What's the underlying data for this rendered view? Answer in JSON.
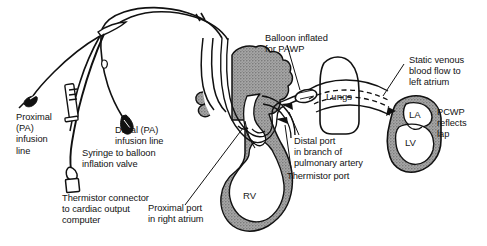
{
  "figure": {
    "type": "medical-line-illustration",
    "background_color": "#ffffff",
    "ink_color": "#111111",
    "tissue_fill_color": "#9d9d9d"
  },
  "annotations": {
    "proximal_infusion": "Proximal\n(PA)\ninfusion\nline",
    "distal_infusion": "Distal (PA)\ninfusion line",
    "syringe_valve": "Syringe to balloon\ninflation valve",
    "thermistor_connector": "Thermistor connector\nto cardiac output\ncomputer",
    "proximal_port": "Proximal port\nin right atrium",
    "balloon_inflated": "Balloon inflated\nfor PAWP",
    "distal_port": "Distal port\nin branch of\npulmonary artery",
    "thermistor_port": "Thermistor port",
    "static_venous": "Static venous\nblood flow to\nleft atrium",
    "pcwp": "PCWP\nreflects\nlap"
  },
  "structures": {
    "right_ventricle": "RV",
    "lungs": "Lungs",
    "left_atrium": "LA",
    "left_ventricle": "LV"
  }
}
